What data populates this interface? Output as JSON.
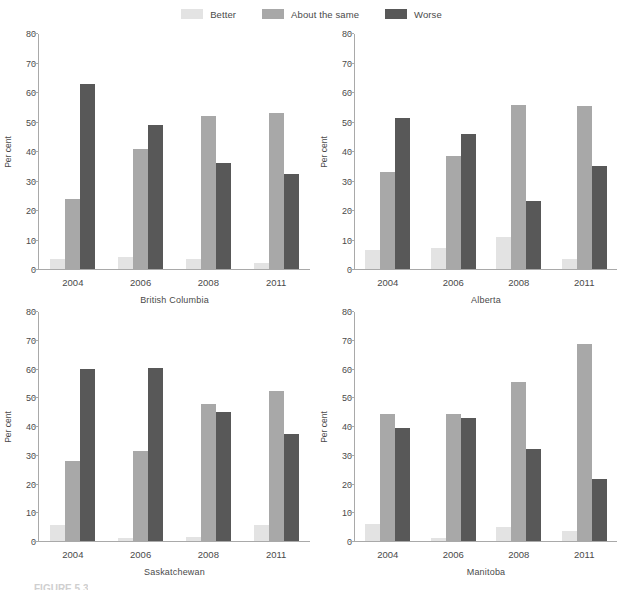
{
  "legend": {
    "position": "top-center",
    "items": [
      {
        "label": "Better",
        "color": "#e3e3e3"
      },
      {
        "label": "About the same",
        "color": "#a8a8a8"
      },
      {
        "label": "Worse",
        "color": "#585858"
      }
    ]
  },
  "axis": {
    "ylabel": "Per cent",
    "yticks": [
      0,
      10,
      20,
      30,
      40,
      50,
      60,
      70,
      80
    ],
    "ylim": [
      0,
      80
    ]
  },
  "figure_caption": "FIGURE 5.3",
  "chart_data": {
    "type": "bar",
    "title": "",
    "xlabel": "",
    "ylabel": "Per cent",
    "ylim": [
      0,
      80
    ],
    "grid": false,
    "legend_position": "top-center",
    "categories": [
      "2004",
      "2006",
      "2008",
      "2011"
    ],
    "panels": [
      {
        "name": "British Columbia",
        "series": [
          {
            "name": "Better",
            "values": [
              3.5,
              4.0,
              3.5,
              2.0
            ]
          },
          {
            "name": "About the same",
            "values": [
              24.0,
              41.0,
              52.0,
              53.0
            ]
          },
          {
            "name": "Worse",
            "values": [
              63.0,
              49.0,
              36.0,
              32.5
            ]
          }
        ]
      },
      {
        "name": "Alberta",
        "series": [
          {
            "name": "Better",
            "values": [
              6.5,
              7.0,
              11.0,
              3.5
            ]
          },
          {
            "name": "About the same",
            "values": [
              33.0,
              38.5,
              56.0,
              55.5
            ]
          },
          {
            "name": "Worse",
            "values": [
              51.5,
              46.0,
              23.0,
              35.0
            ]
          }
        ]
      },
      {
        "name": "Saskatchewan",
        "series": [
          {
            "name": "Better",
            "values": [
              5.5,
              1.2,
              1.3,
              5.7
            ]
          },
          {
            "name": "About the same",
            "values": [
              28.0,
              31.5,
              48.0,
              52.5
            ]
          },
          {
            "name": "Worse",
            "values": [
              60.0,
              60.5,
              45.0,
              37.5
            ]
          }
        ]
      },
      {
        "name": "Manitoba",
        "series": [
          {
            "name": "Better",
            "values": [
              6.0,
              1.2,
              5.0,
              3.5
            ]
          },
          {
            "name": "About the same",
            "values": [
              44.5,
              44.5,
              55.5,
              69.0
            ]
          },
          {
            "name": "Worse",
            "values": [
              39.5,
              43.0,
              32.0,
              21.5
            ]
          }
        ]
      }
    ]
  }
}
